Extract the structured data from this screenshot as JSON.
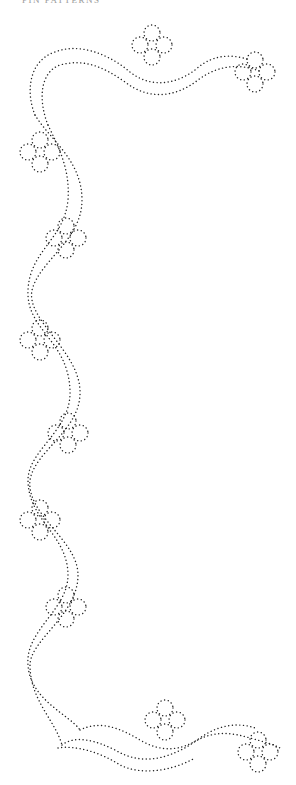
{
  "header": {
    "title": "PIN PATTERNS"
  },
  "pattern": {
    "description": "Dotted pin-prick corner border with ribbon and flowers",
    "dot_color": "#222222",
    "background_color": "#ffffff",
    "flowers": [
      {
        "id": "top-center",
        "cx": 152,
        "cy": 45
      },
      {
        "id": "top-right",
        "cx": 255,
        "cy": 72
      },
      {
        "id": "left-1",
        "cx": 40,
        "cy": 152
      },
      {
        "id": "right-1",
        "cx": 66,
        "cy": 238
      },
      {
        "id": "left-2",
        "cx": 40,
        "cy": 340
      },
      {
        "id": "right-2",
        "cx": 68,
        "cy": 433
      },
      {
        "id": "left-3",
        "cx": 40,
        "cy": 520
      },
      {
        "id": "right-3",
        "cx": 66,
        "cy": 607
      },
      {
        "id": "bottom-center",
        "cx": 165,
        "cy": 720
      },
      {
        "id": "bottom-right",
        "cx": 258,
        "cy": 752
      }
    ]
  }
}
